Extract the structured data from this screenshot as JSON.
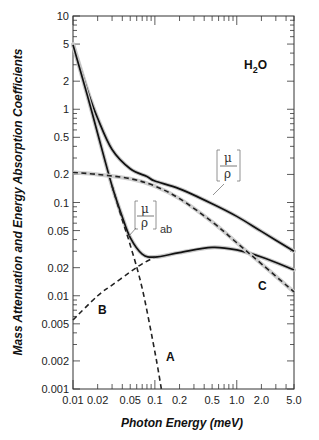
{
  "chart_data": {
    "type": "line",
    "title": "H2O",
    "xlabel": "Photon Energy (meV)",
    "ylabel": "Mass Attenuation and Energy Absorption Coefficients",
    "xscale": "log",
    "yscale": "log",
    "xlim": [
      0.01,
      5.0
    ],
    "ylim": [
      0.001,
      10
    ],
    "grid": false,
    "x_ticks": [
      "0.01",
      "0.02",
      "0.05",
      "0.1",
      "0.2",
      "0.5",
      "1.0",
      "2.0",
      "5.0"
    ],
    "y_ticks": [
      "0.001",
      "0.002",
      "0.005",
      "0.01",
      "0.02",
      "0.05",
      "0.1",
      "0.2",
      "0.5",
      "1",
      "2",
      "5",
      "10"
    ],
    "series": [
      {
        "name": "mu/rho (mass attenuation)",
        "style": "solid",
        "x": [
          0.01,
          0.015,
          0.02,
          0.03,
          0.05,
          0.08,
          0.1,
          0.2,
          0.5,
          1.0,
          2.0,
          5.0
        ],
        "y": [
          5.0,
          1.6,
          0.8,
          0.37,
          0.23,
          0.19,
          0.17,
          0.14,
          0.097,
          0.071,
          0.049,
          0.03
        ]
      },
      {
        "name": "mu/rho ab (energy absorption)",
        "style": "solid",
        "x": [
          0.01,
          0.015,
          0.02,
          0.03,
          0.04,
          0.05,
          0.07,
          0.1,
          0.2,
          0.5,
          1.0,
          2.0,
          5.0
        ],
        "y": [
          4.9,
          1.4,
          0.55,
          0.15,
          0.07,
          0.042,
          0.028,
          0.026,
          0.029,
          0.033,
          0.031,
          0.026,
          0.019
        ]
      },
      {
        "name": "A",
        "style": "dashed",
        "x": [
          0.03,
          0.04,
          0.05,
          0.07,
          0.1,
          0.12
        ],
        "y": [
          0.15,
          0.065,
          0.035,
          0.012,
          0.0025,
          0.001
        ]
      },
      {
        "name": "B",
        "style": "dashed",
        "x": [
          0.01,
          0.02,
          0.03,
          0.05,
          0.07,
          0.1
        ],
        "y": [
          0.0055,
          0.01,
          0.013,
          0.018,
          0.022,
          0.026
        ]
      },
      {
        "name": "C",
        "style": "dashed",
        "x": [
          0.01,
          0.02,
          0.05,
          0.1,
          0.2,
          0.5,
          1.0,
          2.0,
          5.0
        ],
        "y": [
          0.21,
          0.2,
          0.18,
          0.15,
          0.11,
          0.062,
          0.037,
          0.022,
          0.011
        ]
      }
    ],
    "annotations": [
      {
        "text": "H2O",
        "x": 3.0,
        "y": 4.0
      },
      {
        "text": "[mu/rho]",
        "x": 1.3,
        "y": 0.17
      },
      {
        "text": "[mu/rho]ab",
        "x": 0.07,
        "y": 0.06
      },
      {
        "text": "A",
        "x": 0.11,
        "y": 0.0018
      },
      {
        "text": "B",
        "x": 0.022,
        "y": 0.0065
      },
      {
        "text": "C",
        "x": 1.6,
        "y": 0.012
      }
    ]
  },
  "labels": {
    "title_h": "H",
    "title_sub": "2",
    "title_o": "O",
    "xlabel": "Photon Energy (meV)",
    "ylabel": "Mass Attenuation and Energy Absorption Coefficients",
    "mu": "μ",
    "rho": "ρ",
    "ab": "ab",
    "A": "A",
    "B": "B",
    "C": "C"
  }
}
